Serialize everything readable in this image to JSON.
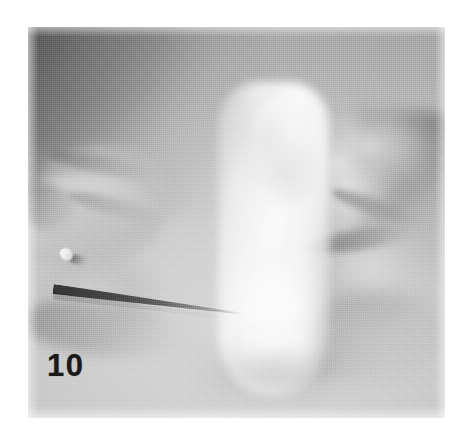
{
  "figure": {
    "number_label": "10",
    "caption": "",
    "medium": "halftone-printed black-and-white photograph"
  },
  "scene": {
    "description": "Two gloved-free hands in close-up: the left hand holds a thin needle-like instrument whose tapered tip points toward a bright white cylindrical object at centre; the right hand steadies the object from the right side.",
    "subjects": [
      {
        "name": "left-hand",
        "role": "holds instrument",
        "position": "left"
      },
      {
        "name": "needle-instrument",
        "role": "thin probe / needle directed at centre",
        "position": "centre-left"
      },
      {
        "name": "white-cylindrical-object",
        "role": "specimen at centre of frame",
        "position": "centre"
      },
      {
        "name": "right-hand",
        "role": "steadies specimen",
        "position": "right"
      }
    ]
  },
  "colors": {
    "page_background": "#ffffff",
    "plate_midtone": "#bebebe",
    "plate_light": "#d9d9d9",
    "plate_shadow": "#4b4b4b",
    "specimen_white": "#ffffff",
    "label_text": "#1a1a1a"
  },
  "plate": {
    "left_px": 28,
    "top_px": 27,
    "width_px": 417,
    "height_px": 391
  }
}
